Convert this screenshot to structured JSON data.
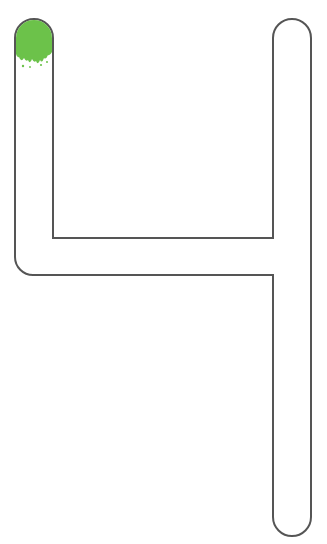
{
  "worksheet": {
    "figure": "4",
    "description": "Number 4 tracing outline with green paint start marker",
    "colors": {
      "outline": "#555555",
      "fill": "#ffffff",
      "start_marker": "#6cc24a"
    }
  }
}
